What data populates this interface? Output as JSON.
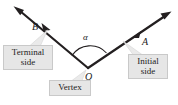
{
  "figure": {
    "type": "angle-diagram",
    "background_color": "#ffffff",
    "stroke_color": "#231f20",
    "callout_fill": "#e6e6e6",
    "callout_border": "#c9c9c9"
  },
  "labels": {
    "point_b": "B",
    "point_a": "A",
    "vertex_point": "O",
    "angle": "α"
  },
  "callouts": {
    "terminal": "Terminal\nside",
    "initial": "Initial\nside",
    "vertex": "Vertex"
  },
  "geometry": {
    "vertex": [
      88,
      68
    ],
    "terminal_ray_tip": [
      14,
      7
    ],
    "initial_ray_tip": [
      170,
      13
    ],
    "terminal_marker": [
      45,
      27
    ],
    "initial_marker": [
      136,
      34
    ],
    "angle_arc_label_pos": [
      86,
      38
    ]
  }
}
